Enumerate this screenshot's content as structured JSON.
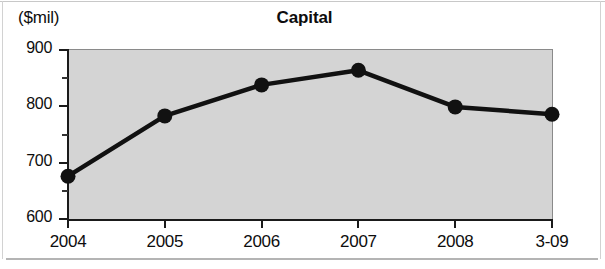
{
  "chart_data": {
    "type": "line",
    "title": "Capital",
    "ylabel": "($mil)",
    "xlabel": "",
    "categories": [
      "2004",
      "2005",
      "2006",
      "2007",
      "2008",
      "3-09"
    ],
    "values": [
      676,
      783,
      838,
      864,
      799,
      786
    ],
    "series": [
      {
        "name": "Capital",
        "values": [
          676,
          783,
          838,
          864,
          799,
          786
        ]
      }
    ],
    "ylim": [
      600,
      900
    ],
    "y_major_ticks": [
      "600",
      "700",
      "800",
      "900"
    ],
    "y_minor_ticks": [
      "650",
      "750",
      "850"
    ],
    "grid": false,
    "legend": "none",
    "marker": "filled-circle",
    "line_color": "#111111",
    "marker_color": "#111111",
    "plot_background": "#d4d4d4",
    "figure_background": "#ffffff"
  }
}
